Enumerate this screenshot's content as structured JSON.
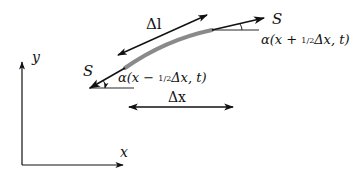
{
  "diagram": {
    "axes": {
      "x_label": "x",
      "y_label": "y"
    },
    "curve": {
      "color": "#8a8a8a",
      "description": "gray thick arc segment"
    },
    "left_end": {
      "tangent_label": "S",
      "angle_label_prefix": "α(x − ",
      "angle_frac": "1/2",
      "angle_label_suffix": "Δx, t)"
    },
    "right_end": {
      "tangent_label": "S",
      "angle_label_prefix": "α(x + ",
      "angle_frac": "1/2",
      "angle_label_suffix": "Δx, t)"
    },
    "arc_length_label": "Δl",
    "horizontal_span_label": "Δx",
    "colors": {
      "ink": "#111111",
      "curve": "#8a8a8a",
      "background": "#ffffff"
    }
  }
}
